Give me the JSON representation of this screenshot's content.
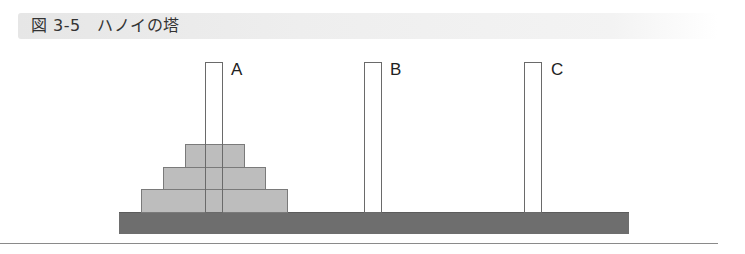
{
  "figure": {
    "title": "図 3-5　ハノイの塔",
    "figure_number": "図 3-5",
    "caption": "ハノイの塔"
  },
  "pegs": [
    {
      "label": "A",
      "left": 205,
      "label_left": 231
    },
    {
      "label": "B",
      "left": 364,
      "label_left": 390
    },
    {
      "label": "C",
      "left": 524,
      "label_left": 551
    }
  ],
  "disks": [
    {
      "name": "small",
      "peg": "A",
      "left": 185,
      "top": 144,
      "width": 60,
      "height": 24
    },
    {
      "name": "medium",
      "peg": "A",
      "left": 163,
      "top": 167,
      "width": 103,
      "height": 23
    },
    {
      "name": "large",
      "peg": "A",
      "left": 141,
      "top": 189,
      "width": 147,
      "height": 24
    }
  ],
  "colors": {
    "disk_fill": "#bdbdbd",
    "base_fill": "#6e6e6e",
    "peg_outline": "#6a6a6a",
    "title_band": "#e6e6e6"
  }
}
